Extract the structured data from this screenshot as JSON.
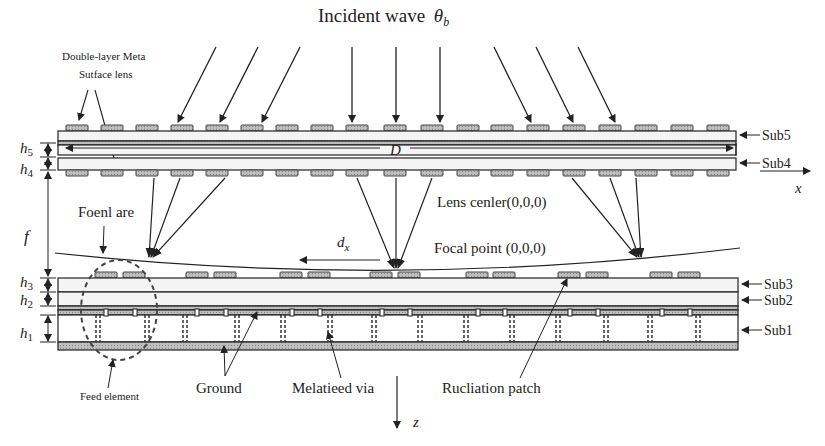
{
  "title": "Incident wave",
  "title_symbol": "θ",
  "title_subscript": "b",
  "labels": {
    "metasurface_line1": "Double-layer Meta",
    "metasurface_line2": "Sutface lens",
    "focal_arc": "Foenl are",
    "lens_center": "Lens cenler(0,0,0)",
    "focal_point": "Focal point (0,0,0)",
    "dx": "d",
    "dx_sub": "x",
    "D": "D",
    "f": "f",
    "x_axis": "x",
    "z_axis": "z",
    "feed_element": "Feed element",
    "ground": "Ground",
    "metallized_via": "Melatieed via",
    "radiation_patch": "Rucliation patch"
  },
  "substrates": [
    "Sub5",
    "Sub4",
    "Sub3",
    "Sub2",
    "Sub1"
  ],
  "heights": [
    {
      "sym": "h",
      "sub": "5"
    },
    {
      "sym": "h",
      "sub": "4"
    },
    {
      "sym": "h",
      "sub": "3"
    },
    {
      "sym": "h",
      "sub": "2"
    },
    {
      "sym": "h",
      "sub": "1"
    }
  ],
  "colors": {
    "line": "#222222",
    "patch": "#9a9a9a",
    "substrate_fill": "#f4f4f4",
    "ground_fill": "#b8b8b8"
  }
}
